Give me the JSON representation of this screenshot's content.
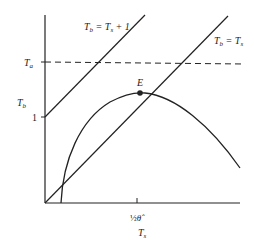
{
  "diagram": {
    "y_axis_label": "T",
    "y_axis_sub": "b",
    "x_axis_label": "T",
    "x_axis_sub": "s",
    "y_ticks": [
      {
        "label": "T",
        "sub": "a"
      },
      {
        "label": "1",
        "sub": ""
      }
    ],
    "x_tick": {
      "frac": "½",
      "symbol": "θ̂"
    },
    "lines": [
      {
        "label": "T",
        "sub1": "b",
        "eq": " = T",
        "sub2": "s",
        "extra": " + 1"
      },
      {
        "label": "T",
        "sub1": "b",
        "eq": " = T",
        "sub2": "s",
        "extra": ""
      }
    ],
    "point_label": "E",
    "color": "#222222"
  }
}
